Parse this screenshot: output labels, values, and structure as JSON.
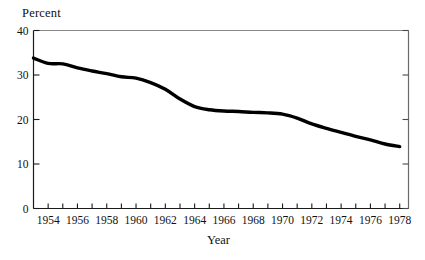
{
  "chart_data": {
    "type": "line",
    "title": "",
    "xlabel": "Year",
    "ylabel": "Percent",
    "xlim": [
      1953,
      1978.6
    ],
    "ylim": [
      0,
      40
    ],
    "yticks": [
      0,
      10,
      20,
      30,
      40
    ],
    "ytick_labels": [
      "0",
      "10",
      "20",
      "30",
      "40"
    ],
    "xticks": [
      1954,
      1955,
      1956,
      1957,
      1958,
      1959,
      1960,
      1961,
      1962,
      1963,
      1964,
      1965,
      1966,
      1967,
      1968,
      1969,
      1970,
      1971,
      1972,
      1973,
      1974,
      1975,
      1976,
      1977,
      1978
    ],
    "xtick_labels_shown": [
      "1954",
      "1956",
      "1958",
      "1960",
      "1962",
      "1964",
      "1966",
      "1968",
      "1970",
      "1972",
      "1974",
      "1976",
      "1978"
    ],
    "grid": false,
    "legend": false,
    "line_color": "#000000",
    "line_width_px": 3.4,
    "x": [
      1953.0,
      1954.0,
      1955.0,
      1956.0,
      1957.0,
      1958.0,
      1959.0,
      1960.0,
      1961.0,
      1962.0,
      1963.0,
      1964.0,
      1965.0,
      1966.0,
      1967.0,
      1968.0,
      1969.0,
      1970.0,
      1971.0,
      1972.0,
      1973.0,
      1974.0,
      1975.0,
      1976.0,
      1977.0,
      1978.0
    ],
    "values": [
      33.8,
      32.6,
      32.5,
      31.6,
      30.9,
      30.3,
      29.6,
      29.3,
      28.3,
      26.8,
      24.6,
      22.9,
      22.2,
      21.9,
      21.8,
      21.6,
      21.5,
      21.2,
      20.3,
      19.0,
      18.0,
      17.1,
      16.2,
      15.4,
      14.5,
      13.9
    ]
  }
}
